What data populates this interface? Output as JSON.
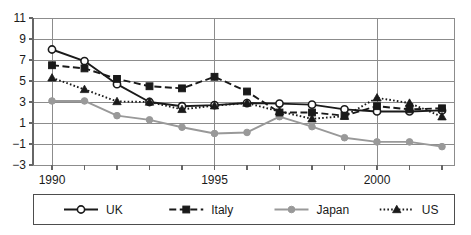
{
  "chart_data": {
    "type": "line",
    "title": "",
    "subtitle": "",
    "xlabel": "",
    "ylabel": "",
    "x": [
      1990,
      1991,
      1992,
      1993,
      1994,
      1995,
      1996,
      1997,
      1998,
      1999,
      2000,
      2001,
      2002
    ],
    "xlim": [
      1989.4,
      2002.6
    ],
    "ylim": [
      -3,
      11
    ],
    "yticks": [
      -3,
      -1,
      1,
      3,
      5,
      7,
      9,
      11
    ],
    "ytick_labels": [
      "−3",
      "−1",
      "1",
      "3",
      "5",
      "7",
      "9",
      "11"
    ],
    "xticks": [
      1990,
      1991,
      1992,
      1993,
      1994,
      1995,
      1996,
      1997,
      1998,
      1999,
      2000,
      2001,
      2002
    ],
    "xtick_labels_shown": [
      "1990",
      "1995",
      "2000"
    ],
    "xtick_labels_shown_at": [
      1990,
      1995,
      2000
    ],
    "grid": "horizontal",
    "grid_color": "#8c8c8c",
    "legend_position": "bottom",
    "series": [
      {
        "name": "UK",
        "values": [
          8.0,
          6.9,
          4.7,
          3.0,
          2.6,
          2.7,
          2.9,
          2.85,
          2.75,
          2.3,
          2.1,
          2.1,
          2.2
        ],
        "color": "#1a1a1a",
        "line_style": "solid",
        "marker": "open-circle"
      },
      {
        "name": "Italy",
        "values": [
          6.5,
          6.2,
          5.2,
          4.5,
          4.3,
          5.4,
          4.0,
          2.0,
          2.0,
          1.7,
          2.6,
          2.3,
          2.4
        ],
        "color": "#1a1a1a",
        "line_style": "dashed",
        "marker": "filled-square"
      },
      {
        "name": "Japan",
        "values": [
          3.1,
          3.1,
          1.7,
          1.3,
          0.6,
          0.0,
          0.1,
          1.6,
          0.65,
          -0.4,
          -0.8,
          -0.8,
          -1.25
        ],
        "color": "#999999",
        "line_style": "solid",
        "marker": "filled-circle"
      },
      {
        "name": "US",
        "values": [
          5.3,
          4.2,
          3.05,
          3.0,
          2.3,
          2.65,
          2.9,
          2.1,
          1.4,
          1.65,
          3.4,
          2.9,
          1.6
        ],
        "color": "#1a1a1a",
        "line_style": "dotted",
        "marker": "filled-triangle"
      }
    ]
  },
  "legend": {
    "items": [
      {
        "label": "UK"
      },
      {
        "label": "Italy"
      },
      {
        "label": "Japan"
      },
      {
        "label": "US"
      }
    ]
  },
  "axis": {
    "y_tick_labels": [
      "11",
      "9",
      "7",
      "5",
      "3",
      "1",
      "−1",
      "−3"
    ],
    "x_tick_labels": [
      "1990",
      "1995",
      "2000"
    ]
  }
}
